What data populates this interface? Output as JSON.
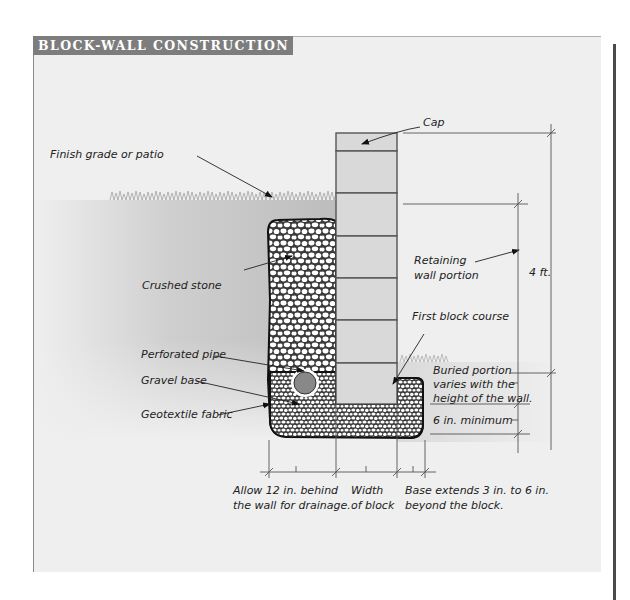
{
  "title": "BLOCK-WALL CONSTRUCTION",
  "colors": {
    "title_bar": "#7d7d7d",
    "panel_bg": "#efefef",
    "block_fill": "#d9d9d9",
    "soil_fill": "#b8b8b8",
    "gravel_outline": "#1a1a1a",
    "pipe_fill": "#888888",
    "rule": "#4a4a4a"
  },
  "labels": {
    "cap": "Cap",
    "finish_grade": "Finish grade or patio",
    "crushed_stone": "Crushed stone",
    "retaining_line1": "Retaining",
    "retaining_line2": "wall portion",
    "height": "4 ft.",
    "first_course": "First block course",
    "perforated_pipe": "Perforated pipe",
    "gravel_base": "Gravel base",
    "geotextile": "Geotextile fabric",
    "buried_line1": "Buried portion",
    "buried_line2": "varies with the",
    "buried_line3": "height of the wall.",
    "six_in": "6 in. minimum",
    "allow_line1": "Allow 12 in. behind",
    "allow_line2": "the wall for drainage.",
    "width_line1": "Width",
    "width_line2": "of block",
    "base_line1": "Base extends 3 in. to 6 in.",
    "base_line2": "beyond the block."
  },
  "structure": {
    "block_courses": 6,
    "cap_count": 1,
    "wall_height": "4 ft.",
    "drainage_allowance": "12 in.",
    "base_extension": "3 in. to 6 in.",
    "base_minimum_depth": "6 in."
  }
}
